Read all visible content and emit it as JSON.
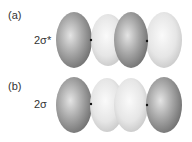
{
  "panels": [
    {
      "label": "(a)",
      "orbital": "2σ*",
      "lobes": [
        "dark",
        "light",
        "dark",
        "light"
      ]
    },
    {
      "label": "(b)",
      "orbital": "2σ",
      "lobes": [
        "dark",
        "light",
        "light",
        "dark"
      ]
    }
  ],
  "colors": {
    "dark": "#8a8a8a",
    "light": "#e6e6e6",
    "nucleus": "#111111"
  }
}
